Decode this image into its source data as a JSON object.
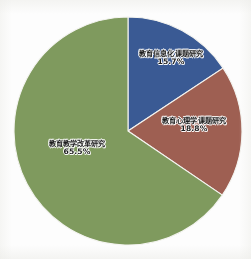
{
  "chart_data": {
    "type": "pie",
    "title": "",
    "subtitle": "",
    "xlabel": "",
    "ylabel": "",
    "legend_position": "none",
    "grid": false,
    "labels_inside": true,
    "start_angle_deg": 0,
    "direction": "clockwise",
    "categories": [
      "教育信息化课题研究",
      "教育心理学课题研究",
      "教育教学改革研究"
    ],
    "values": [
      15.7,
      18.8,
      65.5
    ],
    "value_unit": "%",
    "slices": [
      {
        "name": "教育信息化课题研究",
        "percent_label": "15.7%",
        "value": 15.7,
        "color": "#3a5a94",
        "angle_deg": 56.5
      },
      {
        "name": "教育心理学课题研究",
        "percent_label": "18.8%",
        "value": 18.8,
        "color": "#9e5f52",
        "angle_deg": 67.7
      },
      {
        "name": "教育教学改革研究",
        "percent_label": "65.5%",
        "value": 65.5,
        "color": "#7f9a5e",
        "angle_deg": 235.8
      }
    ]
  },
  "colors": {
    "background": "#ffffff",
    "slice_blue": "#3a5a94",
    "slice_red": "#9e5f52",
    "slice_green": "#7f9a5e",
    "slice_border": "#f4f4f0",
    "label_text": "#1d1d1d"
  }
}
